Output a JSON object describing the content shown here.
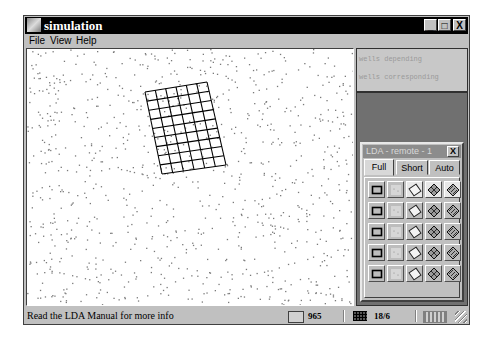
{
  "window": {
    "title": "simulation",
    "controls": {
      "minimize": "_",
      "maximize": "□",
      "close": "X"
    }
  },
  "menu": {
    "items": [
      {
        "label": "File",
        "mnemonic": "F"
      },
      {
        "label": "View",
        "mnemonic": "V"
      },
      {
        "label": "Help",
        "mnemonic": "H"
      }
    ]
  },
  "canvas": {
    "dot_count": 965,
    "dot_color": "#7a7a7a",
    "seed": 17,
    "grid_overlay": {
      "columns": 6,
      "rows": 9,
      "corners": [
        [
          118,
          43
        ],
        [
          180,
          33
        ],
        [
          199,
          116
        ],
        [
          135,
          125
        ]
      ],
      "color": "#000000"
    }
  },
  "side_panel": {
    "lines": [
      "wells depending",
      "wells corresponding"
    ],
    "background": "#707070"
  },
  "lda_panel": {
    "title": "LDA - remote - 1",
    "close_label": "X",
    "tabs": [
      {
        "label": "Full",
        "active": true
      },
      {
        "label": "Short",
        "active": false
      },
      {
        "label": "Auto",
        "active": false
      }
    ],
    "rows": 5,
    "columns": [
      "square-icon",
      "dotted-fill-icon",
      "diamond-icon",
      "grid-diamond-icon",
      "hatched-diamond-icon"
    ]
  },
  "statusbar": {
    "message": "Read the LDA Manual for more info",
    "count": "965",
    "ratio": "18/6"
  }
}
